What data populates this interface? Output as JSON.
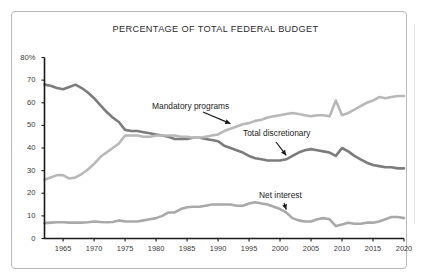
{
  "chart_data": {
    "type": "line",
    "title": "PERCENTAGE OF TOTAL FEDERAL BUDGET",
    "xlabel": "",
    "ylabel": "",
    "xlim": [
      1962,
      2020
    ],
    "ylim": [
      0,
      80
    ],
    "grid": false,
    "legend_position": "inline-annotations",
    "y_ticks": [
      "80%",
      "70",
      "60",
      "50",
      "40",
      "30",
      "20",
      "10",
      "0"
    ],
    "y_tick_values": [
      80,
      70,
      60,
      50,
      40,
      30,
      20,
      10,
      0
    ],
    "x_ticks": [
      "1965",
      "1970",
      "1975",
      "1980",
      "1985",
      "1990",
      "1995",
      "2000",
      "2005",
      "2010",
      "2015",
      "2020"
    ],
    "x_tick_values": [
      1965,
      1970,
      1975,
      1980,
      1985,
      1990,
      1995,
      2000,
      2005,
      2010,
      2015,
      2020
    ],
    "x": [
      1962,
      1963,
      1964,
      1965,
      1966,
      1967,
      1968,
      1969,
      1970,
      1971,
      1972,
      1973,
      1974,
      1975,
      1976,
      1977,
      1978,
      1979,
      1980,
      1981,
      1982,
      1983,
      1984,
      1985,
      1986,
      1987,
      1988,
      1989,
      1990,
      1991,
      1992,
      1993,
      1994,
      1995,
      1996,
      1997,
      1998,
      1999,
      2000,
      2001,
      2002,
      2003,
      2004,
      2005,
      2006,
      2007,
      2008,
      2009,
      2010,
      2011,
      2012,
      2013,
      2014,
      2015,
      2016,
      2017,
      2018,
      2019,
      2020
    ],
    "series": [
      {
        "name": "Total discretionary",
        "color": "#7c7c7c",
        "values": [
          68,
          67.5,
          66.5,
          66,
          67,
          68,
          66.5,
          64.5,
          62,
          59,
          56,
          53.5,
          51.5,
          48,
          47.5,
          47.5,
          47,
          46.5,
          46,
          45.5,
          45,
          44,
          44,
          44,
          44.5,
          44.5,
          44,
          43.5,
          43,
          41,
          40,
          39,
          38,
          36.5,
          35.5,
          35,
          34.5,
          34.5,
          34.5,
          35,
          36.5,
          38,
          39,
          39.5,
          39,
          38.5,
          38,
          36.5,
          40,
          38.5,
          36.5,
          35,
          33.5,
          32.5,
          32,
          31.5,
          31.5,
          31,
          31
        ]
      },
      {
        "name": "Mandatory programs",
        "color": "#b8b8b8",
        "values": [
          26,
          27,
          28,
          28,
          26.5,
          27,
          28.5,
          30.5,
          33,
          36,
          38,
          40,
          42,
          45.5,
          45.5,
          45.5,
          45,
          45,
          45.5,
          45.5,
          45.5,
          45.5,
          45,
          45,
          44.5,
          44.5,
          45,
          45.5,
          46,
          47.5,
          48.5,
          49.5,
          50.5,
          51,
          52,
          52.5,
          53.5,
          54,
          54.5,
          55,
          55.5,
          55,
          54.5,
          54,
          54.5,
          54.5,
          54,
          61,
          54.5,
          55.5,
          57,
          58.5,
          60,
          61,
          62.5,
          62,
          62.5,
          63,
          63
        ]
      },
      {
        "name": "Net interest",
        "color": "#a9a9a9",
        "values": [
          6.8,
          7,
          7.2,
          7.2,
          7,
          7,
          7,
          7.2,
          7.5,
          7.3,
          7.2,
          7.3,
          8,
          7.5,
          7.5,
          7.5,
          8,
          8.5,
          9,
          10,
          11.5,
          11.5,
          13,
          13.8,
          14,
          14,
          14.5,
          15,
          15,
          15,
          15,
          14.5,
          14.5,
          15.5,
          16,
          15.5,
          15,
          14,
          13,
          11.5,
          9,
          8,
          7.5,
          7.5,
          8.5,
          9,
          8.5,
          5.5,
          6.2,
          7,
          6.5,
          6.5,
          7,
          7,
          7.5,
          8.5,
          9.5,
          9.5,
          9
        ]
      }
    ],
    "annotations": [
      {
        "text": "Mandatory programs",
        "target_series": "Mandatory programs",
        "target_x": 1992,
        "target_y": 49
      },
      {
        "text": "Total discretionary",
        "target_series": "Total discretionary",
        "target_x": 2001,
        "target_y": 35
      },
      {
        "text": "Net interest",
        "target_series": "Net interest",
        "target_x": 2001,
        "target_y": 11
      }
    ]
  },
  "axis": {
    "line_color": "#1a1a1a"
  }
}
